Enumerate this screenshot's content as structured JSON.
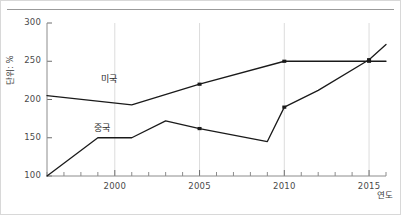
{
  "chart_data": {
    "type": "line",
    "title": "",
    "xlabel": "연도",
    "ylabel": "단위: %",
    "xlim": [
      1996,
      2016
    ],
    "ylim": [
      100,
      300
    ],
    "yticks": [
      100,
      150,
      200,
      250,
      300
    ],
    "xticks": [
      2000,
      2005,
      2010,
      2015
    ],
    "minor_x_interval": 1,
    "grid": "vertical-only",
    "legend": "inline-labels",
    "series": [
      {
        "name": "미국",
        "label_x": 2000,
        "label_y": 228,
        "color": "#1a1a1a",
        "x": [
          1996,
          2001,
          2005,
          2010,
          2015,
          2016
        ],
        "values": [
          205,
          193,
          220,
          250,
          250,
          250
        ]
      },
      {
        "name": "중국",
        "label_x": 1999.6,
        "label_y": 164,
        "color": "#1a1a1a",
        "x": [
          1996,
          1999,
          2001,
          2003,
          2005,
          2009,
          2010,
          2012,
          2015,
          2016
        ],
        "values": [
          100,
          150,
          150,
          172,
          162,
          145,
          190,
          212,
          252,
          272
        ]
      }
    ]
  },
  "axis": {
    "y_tick_labels": [
      "300",
      "250",
      "200",
      "150",
      "100"
    ],
    "x_tick_labels": [
      "2000",
      "2005",
      "2010",
      "2015"
    ],
    "y_title": "단위: %",
    "x_title": "연도"
  },
  "colors": {
    "line": "#1a1a1a",
    "grid": "#dcdcdc",
    "axis": "#8c8c8c",
    "border": "#d8d8d8",
    "tick_text": "#4a4a4a",
    "background": "#ffffff"
  }
}
